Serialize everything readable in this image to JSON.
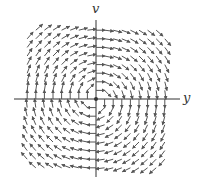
{
  "diagram": {
    "type": "vector-field",
    "axes": {
      "horizontal_label": "y",
      "vertical_label": "v"
    },
    "field": {
      "rotation": "clockwise",
      "vector_formula": "(v, -y)",
      "grid_half_count": 8,
      "grid_spacing_px": 8.6,
      "arrow_length_px": 9
    },
    "colors": {
      "axis": "#333333",
      "arrow": "#555555",
      "background": "#ffffff"
    }
  }
}
